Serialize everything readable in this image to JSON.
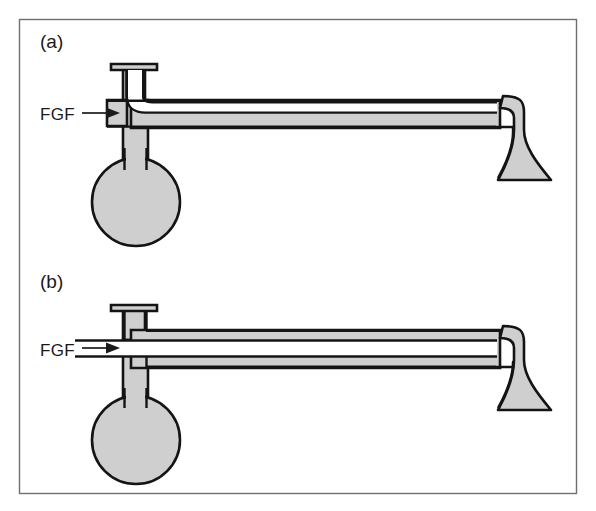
{
  "figure": {
    "domain_type": "diagram",
    "background_color": "#ffffff",
    "frame": {
      "stroke_color": "#6f6f6f",
      "x": 19,
      "y": 19,
      "width": 558,
      "height": 475
    },
    "colors": {
      "tube_fill": "#cfcfcf",
      "outline": "#141414",
      "text": "#1a1a1a",
      "frame": "#6f6f6f"
    },
    "panels": [
      {
        "id": "panel-a",
        "label": "(a)",
        "label_x": 40,
        "label_y": 48,
        "flow_label": "FGF",
        "flow_label_x": 40,
        "flow_label_y": 120,
        "arrow_style": "single-arrow-outside-inner-tube",
        "description": "Mapleson breathing system with fresh gas flow entering at the T-piece; inner tube curves downward from the vertical limb into the horizontal tube toward the patient mask."
      },
      {
        "id": "panel-b",
        "label": "(b)",
        "label_x": 40,
        "label_y": 288,
        "flow_label": "FGF",
        "flow_label_x": 40,
        "flow_label_y": 356,
        "arrow_style": "arrow-inside-straight-inner-tube",
        "description": "Coaxial variant where fresh gas flow passes straight along the inner tube from the T-piece to the patient end."
      }
    ],
    "components": [
      {
        "name": "reservoir-bag",
        "label": ""
      },
      {
        "name": "t-piece-cap",
        "label": ""
      },
      {
        "name": "corrugated-outer-tube",
        "label": ""
      },
      {
        "name": "inner-delivery-tube",
        "label": ""
      },
      {
        "name": "patient-mask-cone",
        "label": ""
      },
      {
        "name": "fgf-arrow",
        "label": ""
      }
    ]
  }
}
